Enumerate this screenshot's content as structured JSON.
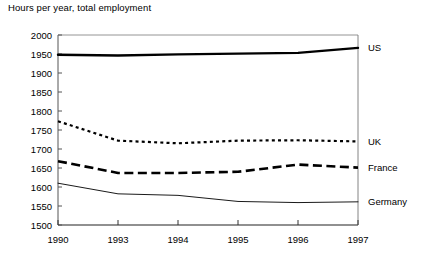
{
  "chart_data": {
    "type": "line",
    "title": "Hours per year, total employment",
    "xlabel": "",
    "ylabel": "",
    "x": [
      "1990",
      "1993",
      "1994",
      "1995",
      "1996",
      "1997"
    ],
    "categories": [
      "1990",
      "1993",
      "1994",
      "1995",
      "1996",
      "1997"
    ],
    "xtick_labels": [
      "1990",
      "1993",
      "1994",
      "1995",
      "1996",
      "1997"
    ],
    "ytick_labels": [
      "2000",
      "1950",
      "1900",
      "1850",
      "1800",
      "1750",
      "1700",
      "1650",
      "1600",
      "1550",
      "1500"
    ],
    "ylim": [
      1500,
      2000
    ],
    "ytick_step": 50,
    "grid": false,
    "legend_position": "right-inline",
    "series": [
      {
        "name": "US",
        "label": "US",
        "style": "solid-thick",
        "color": "#000000",
        "values": [
          1948,
          1946,
          1949,
          1951,
          1953,
          1966
        ]
      },
      {
        "name": "UK",
        "label": "UK",
        "style": "dotted",
        "color": "#000000",
        "values": [
          1773,
          1722,
          1715,
          1722,
          1723,
          1720
        ]
      },
      {
        "name": "France",
        "label": "France",
        "style": "dashed-thick",
        "color": "#000000",
        "values": [
          1668,
          1637,
          1637,
          1640,
          1659,
          1651
        ]
      },
      {
        "name": "Germany",
        "label": "Germany",
        "style": "solid-thin",
        "color": "#000000",
        "values": [
          1610,
          1582,
          1578,
          1562,
          1559,
          1561
        ]
      }
    ]
  }
}
